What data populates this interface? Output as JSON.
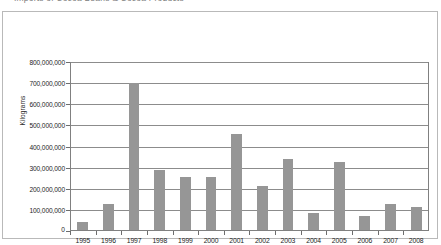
{
  "caption": {
    "text": "Imports of Cocoa Beans & Cocoa Products"
  },
  "chart_data": {
    "type": "bar",
    "title": "",
    "xlabel": "",
    "ylabel": "Kilograms",
    "categories": [
      "1995",
      "1996",
      "1997",
      "1998",
      "1999",
      "2000",
      "2001",
      "2002",
      "2003",
      "2004",
      "2005",
      "2006",
      "2007",
      "2008"
    ],
    "values": [
      45000000,
      130000000,
      700000000,
      290000000,
      255000000,
      255000000,
      460000000,
      215000000,
      340000000,
      85000000,
      325000000,
      70000000,
      130000000,
      115000000
    ],
    "ylim": [
      0,
      800000000
    ],
    "ytick_values": [
      0,
      100000000,
      200000000,
      300000000,
      400000000,
      500000000,
      600000000,
      700000000,
      800000000
    ],
    "ytick_labels": [
      "0",
      "100,000,000",
      "200,000,000",
      "300,000,000",
      "400,000,000",
      "500,000,000",
      "600,000,000",
      "700,000,000",
      "800,000,000"
    ],
    "grid": true,
    "legend": false,
    "legend_position": "none",
    "bar_color": "#969696",
    "axis_color": "#808080",
    "grid_color": "#8c8c8c",
    "background_color": "#ffffff"
  }
}
